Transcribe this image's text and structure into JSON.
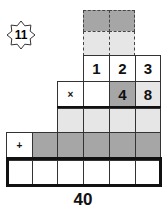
{
  "badge": {
    "label": "11"
  },
  "carry_rows": {
    "top_dark": [
      "",
      ""
    ],
    "second_light": [
      "",
      ""
    ]
  },
  "multiplicand": [
    "1",
    "2",
    "3"
  ],
  "multiplier": {
    "operator": "×",
    "digits": [
      "",
      "4",
      "8"
    ]
  },
  "partial_row_1": [
    "",
    "",
    "",
    ""
  ],
  "partial_row_2": {
    "operator": "+",
    "digits": [
      "",
      "",
      "",
      "",
      ""
    ]
  },
  "answer_row": [
    "",
    "",
    "",
    "",
    "",
    ""
  ],
  "result": "40"
}
